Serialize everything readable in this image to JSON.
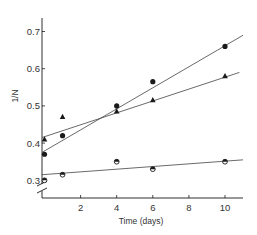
{
  "chart_data": {
    "type": "scatter",
    "title": "",
    "xlabel": "Time (days)",
    "ylabel": "1/N",
    "xlim": [
      0,
      11
    ],
    "ylim": [
      0.25,
      0.75
    ],
    "y_axis_break": true,
    "x_ticks": [
      2,
      4,
      6,
      8,
      10
    ],
    "x_tick_labels": [
      "2",
      "4",
      "6",
      "8",
      "10"
    ],
    "y_ticks": [
      0.3,
      0.4,
      0.5,
      0.6,
      0.7
    ],
    "y_tick_labels": [
      "0.3",
      "0.4",
      "0.5",
      "0.6",
      "0.7"
    ],
    "grid": false,
    "legend": null,
    "series": [
      {
        "name": "filled circles",
        "marker": "circle",
        "x": [
          0,
          1,
          4,
          6,
          10
        ],
        "y": [
          0.37,
          0.42,
          0.5,
          0.565,
          0.66
        ],
        "fit_line": {
          "x": [
            0,
            11
          ],
          "y": [
            0.375,
            0.69
          ]
        }
      },
      {
        "name": "triangles",
        "marker": "triangle",
        "x": [
          0,
          1,
          4,
          6,
          10
        ],
        "y": [
          0.41,
          0.47,
          0.485,
          0.515,
          0.58
        ],
        "fit_line": {
          "x": [
            0,
            10.8
          ],
          "y": [
            0.415,
            0.59
          ]
        }
      },
      {
        "name": "half-filled circles",
        "marker": "half-circle",
        "x": [
          0,
          1,
          4,
          6,
          10
        ],
        "y": [
          0.3,
          0.315,
          0.35,
          0.33,
          0.35
        ],
        "fit_line": {
          "x": [
            0,
            11
          ],
          "y": [
            0.315,
            0.355
          ]
        }
      }
    ]
  },
  "colors": {
    "ink": "#1a1a1a",
    "line": "#444444",
    "background": "#ffffff"
  }
}
